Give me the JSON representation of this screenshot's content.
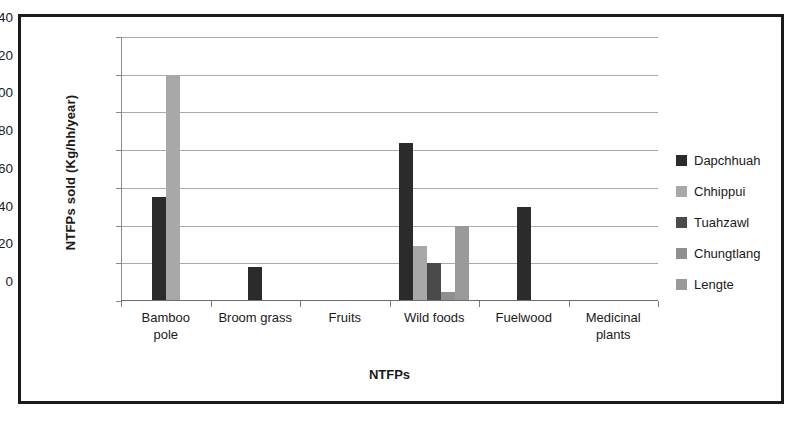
{
  "chart_data": {
    "type": "bar",
    "title": "",
    "xlabel": "NTFPs",
    "ylabel": "NTFPs  sold (Kg/hh/year)",
    "ylim": [
      0,
      140
    ],
    "ytick_step": 20,
    "yticks": [
      0,
      20,
      40,
      60,
      80,
      100,
      120,
      140
    ],
    "grid": true,
    "legend_position": "right",
    "categories": [
      "Bamboo pole",
      "Broom grass",
      "Fruits",
      "Wild foods",
      "Fuelwood",
      "Medicinal plants"
    ],
    "category_lines": [
      [
        "Bamboo",
        "pole"
      ],
      [
        "Broom grass",
        ""
      ],
      [
        "Fruits",
        ""
      ],
      [
        "Wild foods",
        ""
      ],
      [
        "Fuelwood",
        ""
      ],
      [
        "Medicinal",
        "plants"
      ]
    ],
    "series": [
      {
        "name": "Dapchhuah",
        "color": "#2b2b2b",
        "values": [
          55,
          18,
          0,
          84,
          50,
          0
        ]
      },
      {
        "name": "Chhippui",
        "color": "#a8a8a8",
        "values": [
          120,
          0,
          0,
          29,
          0,
          0
        ]
      },
      {
        "name": "Tuahzawl",
        "color": "#4a4a4a",
        "values": [
          0,
          0,
          0,
          20,
          0,
          0
        ]
      },
      {
        "name": "Chungtlang",
        "color": "#8f8f8f",
        "values": [
          0,
          0,
          0,
          5,
          0,
          0
        ]
      },
      {
        "name": "Lengte",
        "color": "#9a9a9a",
        "values": [
          0,
          0,
          0,
          40,
          0,
          0
        ]
      }
    ]
  },
  "colors": {
    "frame": "#1b1b1b",
    "gridline": "#a9a9a9",
    "axis": "#7a7a7a",
    "text": "#1a1a1a",
    "background": "#ffffff"
  }
}
